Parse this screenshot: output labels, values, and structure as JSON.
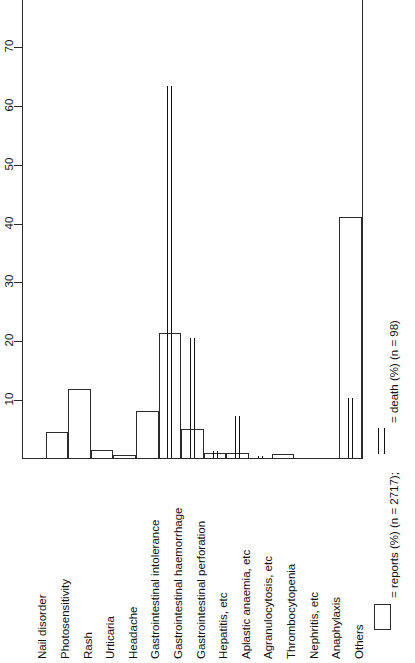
{
  "chart_data": {
    "type": "bar",
    "title": "",
    "xlabel": "",
    "ylabel": "",
    "orientation": "vertical-bars-rotated-labels",
    "grid": false,
    "ylim": [
      0,
      78
    ],
    "yticks": [
      10,
      20,
      30,
      40,
      50,
      60,
      70
    ],
    "ytick_labels": [
      "10",
      "20",
      "30",
      "40",
      "50",
      "60",
      "70"
    ],
    "legend_position": "right",
    "categories": [
      "Nail disorder",
      "Photosensitivity",
      "Rash",
      "Urticaria",
      "Headache",
      "Gastrointestinal intolerance",
      "Gastrointestinal haemorrhage",
      "Gastrointestinal perforation",
      "Hepatitis, etc",
      "Aplastic anaemia, etc",
      "Agranulocytosis, etc",
      "Thrombocytopenia",
      "Nephritis, etc",
      "Anaphylaxis",
      "Others"
    ],
    "series": [
      {
        "name": "reports (%) (n = 2717)",
        "style": "open-bar",
        "values": [
          0,
          4.5,
          11.8,
          1.3,
          0.5,
          8.0,
          21.2,
          5.0,
          0.9,
          0.8,
          0,
          0.6,
          0,
          0,
          41.0
        ]
      },
      {
        "name": "death (%) (n = 98)",
        "style": "double-line",
        "values": [
          0,
          0,
          0,
          0,
          0,
          0,
          63.3,
          20.4,
          1.2,
          7.1,
          0.4,
          0,
          0,
          0,
          10.2
        ]
      }
    ],
    "legend": [
      {
        "symbol": "open-rectangle",
        "label": "= reports (%) (n = 2717);"
      },
      {
        "symbol": "double-vertical-line",
        "label": "= death (%) (n = 98)"
      }
    ]
  }
}
